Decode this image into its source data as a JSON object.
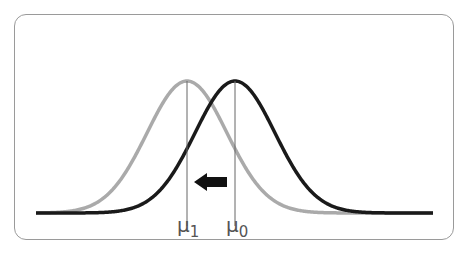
{
  "diagram": {
    "curves": [
      {
        "name": "original",
        "mean_label": "μ0",
        "color": "#1a1a1a",
        "center_x": 235
      },
      {
        "name": "shifted",
        "mean_label": "μ1",
        "color": "#aaaaaa",
        "center_x": 187
      }
    ],
    "arrow": {
      "direction": "left",
      "color": "#111111"
    },
    "labels": {
      "mu1_base": "μ",
      "mu1_sub": "1",
      "mu0_base": "μ",
      "mu0_sub": "0"
    }
  }
}
